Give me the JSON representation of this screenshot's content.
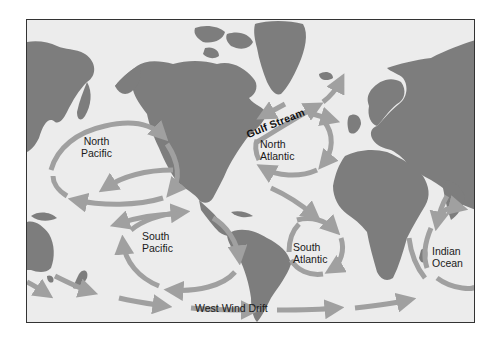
{
  "map": {
    "title": "Major ocean surface currents (gyres)",
    "colors": {
      "ocean": "#ececec",
      "land": "#7d7d7d",
      "current_arrow": "#a0a0a0",
      "border": "#333333",
      "label": "#1a1a1a"
    },
    "labels": {
      "north_pacific": [
        "North",
        "Pacific"
      ],
      "north_atlantic": [
        "North",
        "Atlantic"
      ],
      "south_pacific": [
        "South",
        "Pacific"
      ],
      "south_atlantic": [
        "South",
        "Atlantic"
      ],
      "indian_ocean": [
        "Indian",
        "Ocean"
      ],
      "gulf_stream": "Gulf Stream",
      "west_wind_drift": "West Wind Drift"
    },
    "gyres": [
      {
        "name": "North Pacific",
        "rotation": "clockwise"
      },
      {
        "name": "North Atlantic",
        "rotation": "clockwise"
      },
      {
        "name": "South Pacific",
        "rotation": "counterclockwise"
      },
      {
        "name": "South Atlantic",
        "rotation": "counterclockwise"
      },
      {
        "name": "Indian Ocean",
        "rotation": "counterclockwise"
      }
    ],
    "currents": [
      {
        "name": "Gulf Stream",
        "direction": "northeast"
      },
      {
        "name": "West Wind Drift",
        "direction": "east"
      }
    ]
  }
}
